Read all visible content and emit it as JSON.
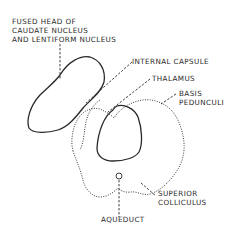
{
  "diagram": {
    "labels": {
      "fused_head": [
        "FUSED HEAD OF",
        "CAUDATE NUCLEUS",
        "AND LENTIFORM NUCLEUS"
      ],
      "internal_capsule": "INTERNAL CAPSULE",
      "thalamus": "THALAMUS",
      "basis_pedunculi": [
        "BASIS",
        "PEDUNCULI"
      ],
      "superior_colliculus": [
        "SUPERIOR",
        "COLLICULUS"
      ],
      "aqueduct": "AQUEDUCT"
    },
    "colors": {
      "ink": "#2a2a2a",
      "background": "#ffffff"
    }
  }
}
